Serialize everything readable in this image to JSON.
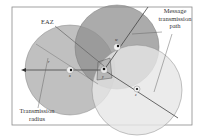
{
  "diagram": {
    "labels": {
      "eaz": "EAZ",
      "message_path_line1": "Message",
      "message_path_line2": "transmission",
      "message_path_line3": "path",
      "radius_line1": "Transmission",
      "radius_line2": "radius",
      "r": "r"
    },
    "nodes": [
      {
        "id": "x",
        "label": "x",
        "cx": 70,
        "cy": 70
      },
      {
        "id": "w",
        "label": "w",
        "cx": 117,
        "cy": 47
      },
      {
        "id": "y",
        "label": "y",
        "cx": 104,
        "cy": 70
      },
      {
        "id": "z",
        "label": "z",
        "cx": 137,
        "cy": 89
      }
    ],
    "circles": [
      {
        "id": "circle-x",
        "cx": 70,
        "cy": 70,
        "r": 45,
        "fill": "#b8b8b8"
      },
      {
        "id": "circle-w",
        "cx": 117,
        "cy": 47,
        "r": 42,
        "fill": "#9a9a9a"
      },
      {
        "id": "circle-z",
        "cx": 137,
        "cy": 90,
        "r": 45,
        "fill": "#e2e2e2"
      }
    ],
    "colors": {
      "frame": "#888888",
      "line": "#555555",
      "text": "#333333"
    }
  }
}
